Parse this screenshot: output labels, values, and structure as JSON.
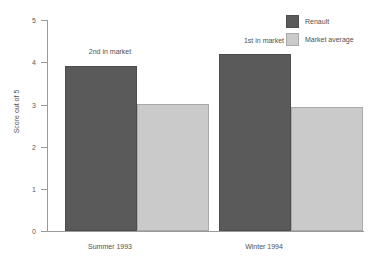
{
  "chart_data": {
    "type": "bar",
    "title": "",
    "xlabel": "",
    "ylabel": "Score out of 5",
    "ylim": [
      0,
      5
    ],
    "yticks": [
      "0",
      "1",
      "2",
      "3",
      "4",
      "5"
    ],
    "grid": false,
    "legend_position": "top-right",
    "categories": [
      "Summer 1993",
      "Winter 1994"
    ],
    "series": [
      {
        "name": "Renault",
        "color": "#5a5a5a",
        "values": [
          3.9,
          4.2
        ]
      },
      {
        "name": "Market average",
        "color": "#cacaca",
        "values": [
          3.0,
          2.93
        ]
      }
    ],
    "annotations": [
      {
        "text": "2nd in market",
        "category": "Summer 1993"
      },
      {
        "text": "1st in market",
        "category": "Winter 1994"
      }
    ]
  },
  "axis": {
    "y_title": "Score out of 5",
    "tick_0": "0",
    "tick_1": "1",
    "tick_2": "2",
    "tick_3": "3",
    "tick_4": "4",
    "tick_5": "5"
  },
  "categories": {
    "first": "Summer 1993",
    "second": "Winter 1994"
  },
  "annotations": {
    "summer": "2nd in market",
    "winter": "1st in market"
  },
  "legend": {
    "renault": "Renault",
    "market_average": "Market average"
  },
  "colors": {
    "renault": "#5a5a5a",
    "market_average": "#cacaca",
    "axis": "#9a9a9a",
    "text": "#4f4f4f",
    "background": "#ffffff"
  }
}
